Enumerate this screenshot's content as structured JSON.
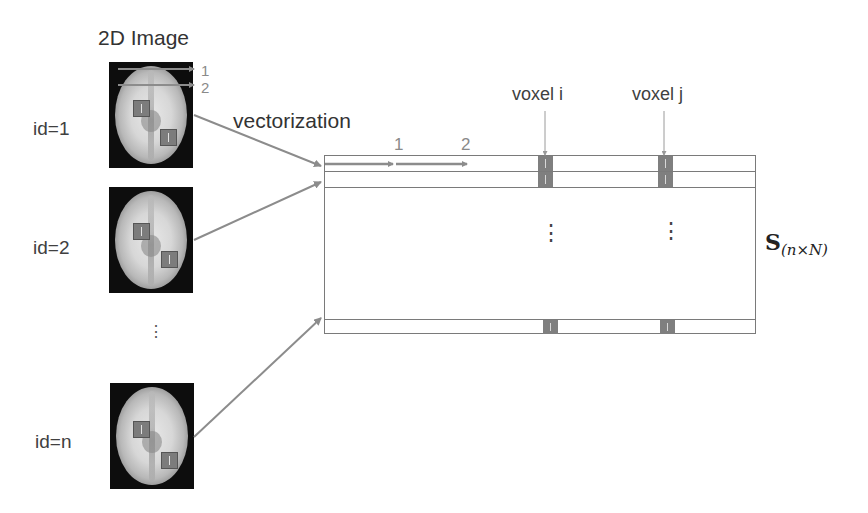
{
  "header": {
    "title": "2D Image"
  },
  "subjects": [
    {
      "label": "id=1"
    },
    {
      "label": "id=2"
    },
    {
      "label": "id=n"
    }
  ],
  "ellipsis_left": "⋮",
  "scan_lines": {
    "first": "1",
    "second": "2"
  },
  "process_label": "vectorization",
  "matrix": {
    "row_order_labels": {
      "first": "1",
      "second": "2"
    },
    "column_labels": {
      "voxel_i": "voxel i",
      "voxel_j": "voxel j"
    },
    "name": "S",
    "dims": "(n×N)",
    "ellipsis": "⋮"
  },
  "colors": {
    "arrow": "#8c8c8c",
    "line": "#7a7a7a",
    "voxel": "#7c7c7c",
    "background": "#ffffff"
  }
}
